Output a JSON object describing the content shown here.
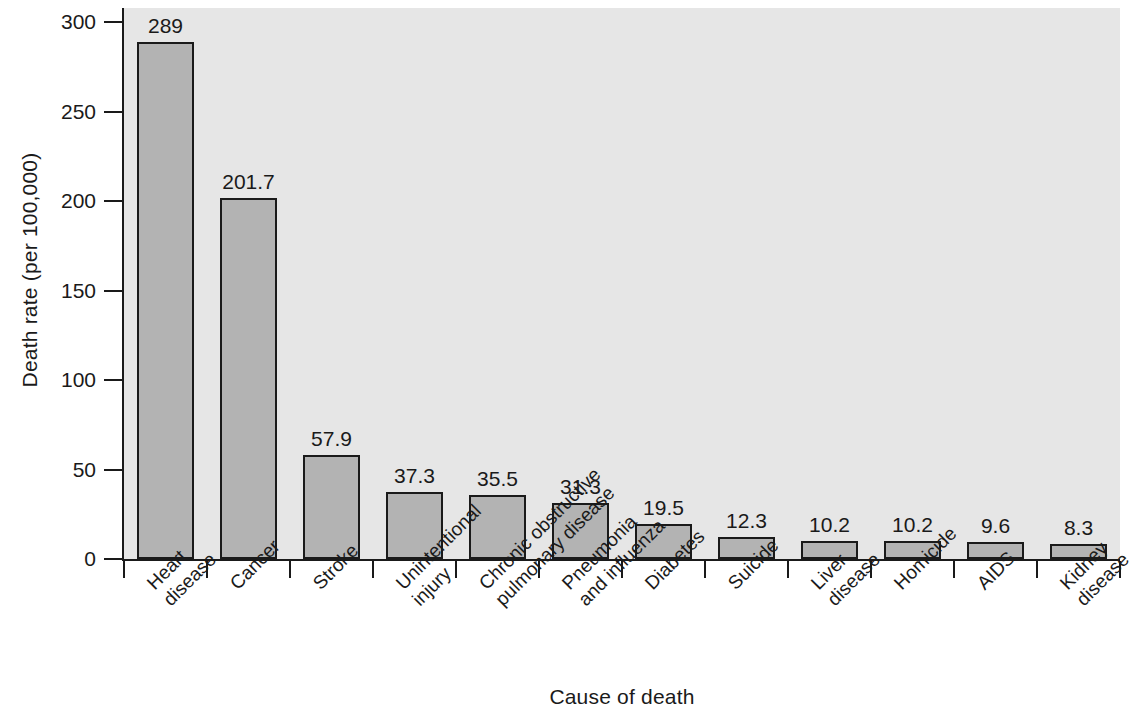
{
  "chart_data": {
    "type": "bar",
    "title": "",
    "xlabel": "Cause of death",
    "ylabel": "Death rate (per 100,000)",
    "ylim": [
      0,
      300
    ],
    "yticks": [
      0,
      50,
      100,
      150,
      200,
      250,
      300
    ],
    "ytick_labels": [
      "0",
      "50",
      "100",
      "150",
      "200",
      "250",
      "300"
    ],
    "grid": false,
    "legend": "none",
    "bar_color": "#b3b3b3",
    "bar_edge_color": "#1a1a1a",
    "panel_color": "#e6e6e6",
    "categories": [
      "Heart disease",
      "Cancer",
      "Stroke",
      "Unintentional injury",
      "Chronic obstructive pulmonary disease",
      "Pneumonia and influenza",
      "Diabetes",
      "Suicide",
      "Liver disease",
      "Homicide",
      "AIDS",
      "Kidney disease"
    ],
    "category_lines": [
      [
        "Heart",
        "disease"
      ],
      [
        "Cancer",
        ""
      ],
      [
        "Stroke",
        ""
      ],
      [
        "Unintentional",
        "injury"
      ],
      [
        "Chronic obstructive",
        "pulmonary disease"
      ],
      [
        "Pneumonia",
        "and influenza"
      ],
      [
        "Diabetes",
        ""
      ],
      [
        "Suicide",
        ""
      ],
      [
        "Liver",
        "disease"
      ],
      [
        "Homicide",
        ""
      ],
      [
        "AIDS",
        ""
      ],
      [
        "Kidney",
        "disease"
      ]
    ],
    "values": [
      289,
      201.7,
      57.9,
      37.3,
      35.5,
      31.3,
      19.5,
      12.3,
      10.2,
      10.2,
      9.6,
      8.3
    ],
    "value_labels": [
      "289",
      "201.7",
      "57.9",
      "37.3",
      "35.5",
      "31.3",
      "19.5",
      "12.3",
      "10.2",
      "10.2",
      "9.6",
      "8.3"
    ]
  }
}
